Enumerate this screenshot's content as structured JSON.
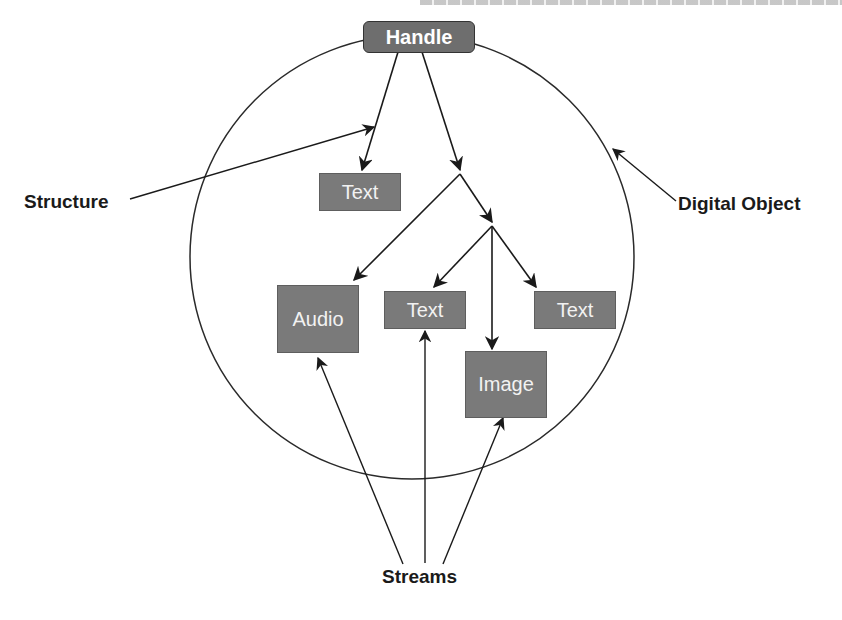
{
  "diagram": {
    "type": "digital-object-structure",
    "root": {
      "label": "Handle"
    },
    "nodes": [
      {
        "id": "text1",
        "label": "Text"
      },
      {
        "id": "audio",
        "label": "Audio"
      },
      {
        "id": "text2",
        "label": "Text"
      },
      {
        "id": "text3",
        "label": "Text"
      },
      {
        "id": "image",
        "label": "Image"
      }
    ],
    "annotations": {
      "structure": "Structure",
      "digital_object": "Digital Object",
      "streams": "Streams"
    },
    "colors": {
      "box_fill": "#7a7a7a",
      "handle_fill": "#6e6e6e",
      "box_text": "#f2f2f2",
      "line": "#1a1a1a"
    }
  }
}
